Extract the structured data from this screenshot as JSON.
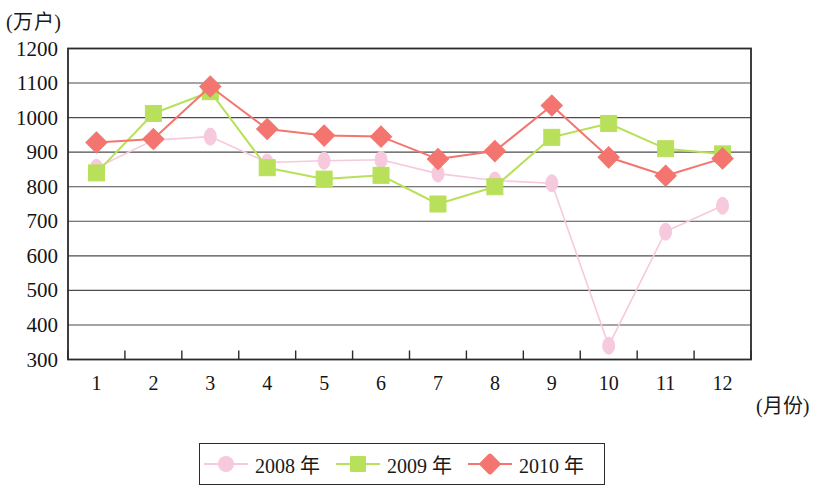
{
  "chart_data": {
    "type": "line",
    "title": "",
    "ylabel": "(万户)",
    "xlabel": "(月份)",
    "categories": [
      "1",
      "2",
      "3",
      "4",
      "5",
      "6",
      "7",
      "8",
      "9",
      "10",
      "11",
      "12"
    ],
    "ylim": [
      300,
      1200
    ],
    "ytick_step": 100,
    "yticks": [
      "1200",
      "1100",
      "1000",
      "900",
      "800",
      "700",
      "600",
      "500",
      "400",
      "300"
    ],
    "grid": true,
    "grid_axis": "y",
    "legend_position": "bottom",
    "series": [
      {
        "name": "2008 年",
        "color": "#f7c9dd",
        "marker": "circle",
        "values": [
          855,
          935,
          945,
          870,
          875,
          878,
          838,
          818,
          810,
          340,
          670,
          745
        ]
      },
      {
        "name": "2009 年",
        "color": "#b9e05a",
        "marker": "square",
        "values": [
          840,
          1012,
          1075,
          855,
          822,
          833,
          750,
          800,
          943,
          983,
          910,
          895
        ]
      },
      {
        "name": "2010 年",
        "color": "#f4756f",
        "marker": "diamond",
        "values": [
          928,
          938,
          1090,
          967,
          948,
          945,
          880,
          903,
          1035,
          885,
          832,
          882
        ]
      }
    ]
  },
  "legend": {
    "items": [
      {
        "label": "2008 年"
      },
      {
        "label": "2009 年"
      },
      {
        "label": "2010 年"
      }
    ]
  },
  "axes": {
    "y_unit_label": "(万户)",
    "x_unit_label": "(月份)"
  }
}
